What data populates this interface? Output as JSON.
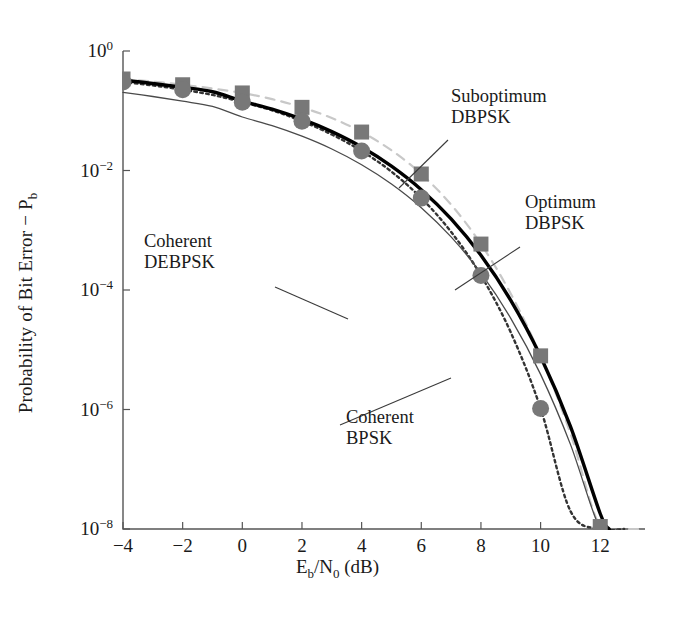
{
  "chart_data": {
    "type": "line",
    "title": "",
    "xlabel": "E_b/N_0 (dB)",
    "ylabel": "Probability of Bit Error − P_b",
    "xlim": [
      -4,
      13.5
    ],
    "ylim": [
      1e-08,
      1
    ],
    "yscale": "log",
    "grid": false,
    "legend": "annotations",
    "xticks": [
      -4,
      -2,
      0,
      2,
      4,
      6,
      8,
      10,
      12
    ],
    "xticklabels": [
      "−4",
      "−2",
      "0",
      "2",
      "4",
      "6",
      "8",
      "10",
      "12"
    ],
    "yticks": [
      1,
      0.01,
      0.0001,
      1e-06,
      1e-08
    ],
    "yticklabels": [
      "10^0",
      "10^-2",
      "10^-4",
      "10^-6",
      "10^-8"
    ],
    "series": [
      {
        "name": "Coherent BPSK",
        "style": "thin-solid-gray",
        "color": "#4a4a4a",
        "marker": "none",
        "x": [
          -4,
          -3,
          -2,
          -1,
          0,
          1,
          2,
          3,
          4,
          5,
          6,
          7,
          8,
          9,
          10,
          11,
          12,
          12.6
        ],
        "y": [
          0.2034,
          0.1731,
          0.1444,
          0.118,
          0.0786,
          0.0563,
          0.0375,
          0.0229,
          0.0125,
          0.00595,
          0.00239,
          0.000773,
          0.000191,
          3.36e-05,
          3.87e-06,
          2.61e-07,
          9.01e-09,
          1e-09
        ]
      },
      {
        "name": "Coherent DEBPSK",
        "style": "thick-solid-black",
        "color": "#000000",
        "marker": "none",
        "x": [
          -4,
          -3,
          -2,
          -1,
          0,
          1,
          2,
          3,
          4,
          5,
          6,
          7,
          8,
          9,
          10,
          11,
          12,
          12.3
        ],
        "y": [
          0.3241,
          0.2862,
          0.2471,
          0.2081,
          0.1448,
          0.1063,
          0.0722,
          0.0447,
          0.0247,
          0.0118,
          0.00477,
          0.00155,
          0.000382,
          6.72e-05,
          7.74e-06,
          5.22e-07,
          1.8e-08,
          1e-09
        ]
      },
      {
        "name": "Optimum DBPSK",
        "style": "dotted-dark",
        "color": "#333333",
        "marker": "circle",
        "markerx": [
          -4,
          -2,
          0,
          2,
          4,
          6,
          8,
          10
        ],
        "x": [
          -4,
          -3,
          -2,
          -1,
          0,
          1,
          2,
          3,
          4,
          5,
          6,
          7,
          8,
          9,
          10,
          11,
          12,
          12.8
        ],
        "y": [
          0.3021,
          0.2654,
          0.2251,
          0.1839,
          0.1394,
          0.1016,
          0.0668,
          0.04,
          0.0212,
          0.00956,
          0.00345,
          0.00094,
          0.000175,
          1.95e-05,
          1.04e-06,
          2e-08,
          5e-10,
          1e-10
        ]
      },
      {
        "name": "Suboptimum DBPSK",
        "style": "dashed-light",
        "color": "#c8c8c8",
        "marker": "square",
        "markerx": [
          -4,
          -2,
          0,
          2,
          4,
          6,
          8,
          10,
          12
        ],
        "x": [
          -4,
          -3,
          -2,
          -1,
          0,
          1,
          2,
          3,
          4,
          5,
          6,
          7,
          8,
          9,
          10,
          11,
          12,
          13,
          13.5
        ],
        "y": [
          0.3399,
          0.3072,
          0.2723,
          0.2358,
          0.1985,
          0.1563,
          0.114,
          0.0755,
          0.044,
          0.0218,
          0.00873,
          0.00268,
          0.000587,
          8.67e-05,
          7.9e-06,
          4e-07,
          1.1e-08,
          1.5e-10,
          1e-11
        ]
      }
    ],
    "annotations": [
      {
        "text_line1": "Suboptimum",
        "text_line2": "DBPSK",
        "tx": 451,
        "ty": 86,
        "leader": [
          [
            448,
            140
          ],
          [
            399,
            188
          ]
        ]
      },
      {
        "text_line1": "Optimum",
        "text_line2": "DBPSK",
        "tx": 525,
        "ty": 192,
        "leader": [
          [
            520,
            247
          ],
          [
            455,
            290
          ]
        ]
      },
      {
        "text_line1": "Coherent",
        "text_line2": "DEBPSK",
        "tx": 144,
        "ty": 231,
        "leader": [
          [
            275,
            287
          ],
          [
            348,
            319
          ]
        ]
      },
      {
        "text_line1": "Coherent",
        "text_line2": "BPSK",
        "tx": 346,
        "ty": 407,
        "leader": [
          [
            340,
            425
          ],
          [
            451,
            378
          ]
        ]
      }
    ]
  }
}
